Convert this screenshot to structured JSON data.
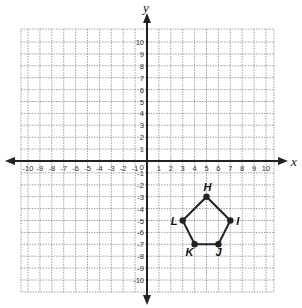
{
  "diagram": {
    "type": "coordinate-plane",
    "axes": {
      "x_label": "x",
      "y_label": "y",
      "x_range": [
        -10,
        10
      ],
      "y_range": [
        -10,
        10
      ],
      "x_ticks": [
        "-10",
        "-9",
        "-8",
        "-7",
        "-6",
        "-5",
        "-4",
        "-3",
        "-2",
        "-1",
        "1",
        "2",
        "3",
        "4",
        "5",
        "6",
        "7",
        "8",
        "9",
        "10"
      ],
      "y_ticks": [
        "10",
        "9",
        "8",
        "7",
        "6",
        "5",
        "4",
        "3",
        "2",
        "1",
        "-1",
        "-2",
        "-3",
        "-4",
        "-5",
        "-6",
        "-7",
        "-8",
        "-9",
        "-10"
      ],
      "origin_label": "0"
    },
    "polygon": {
      "name": "pentagon HIJKL",
      "vertices": [
        {
          "label": "H",
          "x": 5,
          "y": -3
        },
        {
          "label": "I",
          "x": 7,
          "y": -5
        },
        {
          "label": "J",
          "x": 6,
          "y": -7
        },
        {
          "label": "K",
          "x": 4,
          "y": -7
        },
        {
          "label": "L",
          "x": 3,
          "y": -5
        }
      ]
    },
    "colors": {
      "grid": "#888888",
      "axis": "#222222",
      "polygon": "#222222"
    }
  }
}
